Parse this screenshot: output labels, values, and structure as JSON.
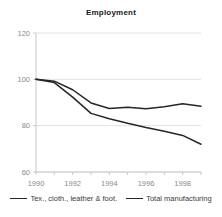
{
  "chart": {
    "title": "Employment"
  },
  "legend": {
    "position": "bottom",
    "entries": [
      {
        "label": "Tex., cloth., leather & foot.",
        "color": "#262626",
        "swatch_name": "legend-line-swatch"
      },
      {
        "label": "Total manufacturing",
        "color": "#262626",
        "swatch_name": "legend-line-swatch"
      }
    ]
  },
  "axes": {
    "y_ticks": [
      "120",
      "100",
      "80",
      "60"
    ],
    "x_ticks": [
      "1990",
      "1992",
      "1994",
      "1996",
      "1998"
    ]
  },
  "chart_data": {
    "type": "line",
    "title": "Employment",
    "xlabel": "",
    "ylabel": "",
    "xlim": [
      1990,
      1999
    ],
    "ylim": [
      60,
      120
    ],
    "yticks": [
      60,
      80,
      100,
      120
    ],
    "xticks": [
      1990,
      1992,
      1994,
      1996,
      1998
    ],
    "grid": true,
    "legend_position": "bottom",
    "x": [
      1990,
      1991,
      1992,
      1993,
      1994,
      1995,
      1996,
      1997,
      1998,
      1999
    ],
    "series": [
      {
        "name": "Tex., cloth., leather & foot.",
        "color": "#262626",
        "values": [
          100.0,
          98.6,
          92.3,
          85.3,
          83.0,
          81.0,
          79.2,
          77.6,
          75.8,
          72.0
        ]
      },
      {
        "name": "Total manufacturing",
        "color": "#262626",
        "values": [
          100.0,
          99.2,
          95.5,
          89.8,
          87.4,
          88.0,
          87.3,
          88.2,
          89.5,
          88.4
        ]
      }
    ]
  },
  "style": {
    "grid_color": "#e2e2e2",
    "axis_color": "#c8c8c8",
    "line_color": "#262626",
    "tick_label_color": "#8a8a8a",
    "title_color": "#1a1a1a",
    "background": "#ffffff"
  }
}
